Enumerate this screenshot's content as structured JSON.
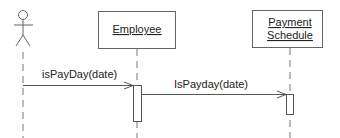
{
  "diagram": {
    "type": "uml-sequence",
    "actor": {
      "label": ""
    },
    "objects": [
      {
        "id": "employee",
        "lines": [
          "Employee"
        ]
      },
      {
        "id": "payment-schedule",
        "lines": [
          "Payment",
          "Schedule"
        ]
      }
    ],
    "messages": [
      {
        "from": "actor",
        "to": "employee",
        "label": "isPayDay(date)"
      },
      {
        "from": "employee",
        "to": "payment-schedule",
        "label": "IsPayday(date)"
      }
    ],
    "colors": {
      "line": "#555555",
      "dash": "#777777",
      "text": "#222222",
      "box_border": "#666666"
    }
  }
}
